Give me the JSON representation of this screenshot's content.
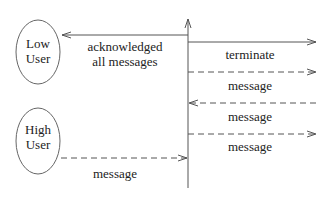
{
  "diagram": {
    "type": "sequence-diagram",
    "actors": [
      {
        "id": "low",
        "line1": "Low",
        "line2": "User"
      },
      {
        "id": "high",
        "line1": "High",
        "line2": "User"
      }
    ],
    "messages": [
      {
        "label": "acknowledged",
        "label2": "all messages",
        "from": "system",
        "to": "low",
        "style": "solid"
      },
      {
        "label": "terminate",
        "from": "system",
        "to": "right",
        "style": "solid"
      },
      {
        "label": "message",
        "from": "system",
        "to": "right",
        "style": "dashed"
      },
      {
        "label": "message",
        "from": "right",
        "to": "system",
        "style": "dashed"
      },
      {
        "label": "message",
        "from": "system",
        "to": "right",
        "style": "dashed"
      },
      {
        "label": "message",
        "from": "high",
        "to": "system",
        "style": "dashed"
      }
    ],
    "colors": {
      "line": "#555555",
      "text": "#222222",
      "background": "#ffffff"
    }
  }
}
